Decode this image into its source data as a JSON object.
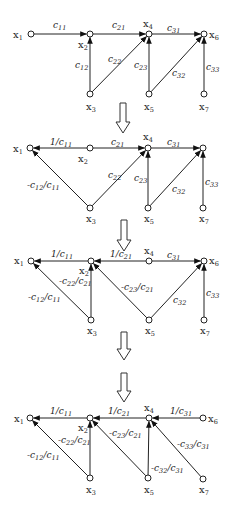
{
  "diagrams": [
    {
      "name": "original-graph",
      "nodes": [
        {
          "id": "x1",
          "label": "x",
          "sub": "1",
          "x": 31,
          "y": 34,
          "lx": 13,
          "ly": 38
        },
        {
          "id": "x2",
          "label": "x",
          "sub": "2",
          "x": 90,
          "y": 34,
          "lx": 78,
          "ly": 48
        },
        {
          "id": "x3",
          "label": "x",
          "sub": "3",
          "x": 90,
          "y": 94,
          "lx": 86,
          "ly": 110
        },
        {
          "id": "x4",
          "label": "x",
          "sub": "4",
          "x": 149,
          "y": 34,
          "lx": 143,
          "ly": 27
        },
        {
          "id": "x5",
          "label": "x",
          "sub": "5",
          "x": 149,
          "y": 94,
          "lx": 144,
          "ly": 110
        },
        {
          "id": "x6",
          "label": "x",
          "sub": "6",
          "x": 204,
          "y": 34,
          "lx": 209,
          "ly": 38
        },
        {
          "id": "x7",
          "label": "x",
          "sub": "7",
          "x": 204,
          "y": 94,
          "lx": 199,
          "ly": 110
        }
      ],
      "edges": [
        {
          "from": "x1",
          "to": "x2",
          "label": "c",
          "sub": "11",
          "lx": 53,
          "ly": 28
        },
        {
          "from": "x3",
          "to": "x2",
          "label": "c",
          "sub": "12",
          "lx": 75,
          "ly": 68
        },
        {
          "from": "x2",
          "to": "x4",
          "label": "c",
          "sub": "21",
          "lx": 112,
          "ly": 28
        },
        {
          "from": "x3",
          "to": "x4",
          "label": "c",
          "sub": "22",
          "lx": 108,
          "ly": 62
        },
        {
          "from": "x5",
          "to": "x4",
          "label": "c",
          "sub": "23",
          "lx": 134,
          "ly": 68
        },
        {
          "from": "x4",
          "to": "x6",
          "label": "c",
          "sub": "31",
          "lx": 167,
          "ly": 31
        },
        {
          "from": "x5",
          "to": "x6",
          "label": "c",
          "sub": "32",
          "lx": 172,
          "ly": 76
        },
        {
          "from": "x7",
          "to": "x6",
          "label": "c",
          "sub": "33",
          "lx": 206,
          "ly": 70
        }
      ]
    },
    {
      "name": "step-1-graph",
      "nodes": [
        {
          "id": "x1",
          "label": "x",
          "sub": "1",
          "x": 30,
          "y": 148,
          "lx": 13,
          "ly": 152
        },
        {
          "id": "x2",
          "label": "x",
          "sub": "2",
          "x": 90,
          "y": 148,
          "lx": 78,
          "ly": 162
        },
        {
          "id": "x3",
          "label": "x",
          "sub": "3",
          "x": 90,
          "y": 208,
          "lx": 86,
          "ly": 222
        },
        {
          "id": "x4",
          "label": "x",
          "sub": "4",
          "x": 148,
          "y": 148,
          "lx": 143,
          "ly": 140
        },
        {
          "id": "x5",
          "label": "x",
          "sub": "5",
          "x": 148,
          "y": 208,
          "lx": 144,
          "ly": 222
        },
        {
          "id": "x6",
          "label": "x",
          "sub": "6",
          "x": 203,
          "y": 148,
          "lx": 0,
          "ly": 0,
          "hidden_label": true
        },
        {
          "id": "x7",
          "label": "x",
          "sub": "7",
          "x": 203,
          "y": 208,
          "lx": 199,
          "ly": 222
        }
      ],
      "edges": [
        {
          "from": "x2",
          "to": "x1",
          "label": "1/c",
          "sub": "11",
          "lx": 50,
          "ly": 145
        },
        {
          "from": "x3",
          "to": "x1",
          "label": "-c",
          "sub": "12",
          "tail": "/c",
          "sub2": "11",
          "lx": 27,
          "ly": 188
        },
        {
          "from": "x2",
          "to": "x4",
          "label": "c",
          "sub": "21",
          "lx": 111,
          "ly": 145
        },
        {
          "from": "x3",
          "to": "x4",
          "label": "c",
          "sub": "22",
          "lx": 108,
          "ly": 178
        },
        {
          "from": "x5",
          "to": "x4",
          "label": "c",
          "sub": "23",
          "lx": 134,
          "ly": 181
        },
        {
          "from": "x4",
          "to": "x6",
          "label": "c",
          "sub": "31",
          "lx": 167,
          "ly": 145
        },
        {
          "from": "x5",
          "to": "x6",
          "label": "c",
          "sub": "32",
          "lx": 172,
          "ly": 192
        },
        {
          "from": "x7",
          "to": "x6",
          "label": "c",
          "sub": "33",
          "lx": 205,
          "ly": 185
        }
      ]
    },
    {
      "name": "step-2-graph",
      "nodes": [
        {
          "id": "x1",
          "label": "x",
          "sub": "1",
          "x": 31,
          "y": 261,
          "lx": 14,
          "ly": 264
        },
        {
          "id": "x2",
          "label": "x",
          "sub": "2",
          "x": 91,
          "y": 261,
          "lx": 79,
          "ly": 274
        },
        {
          "id": "x3",
          "label": "x",
          "sub": "3",
          "x": 91,
          "y": 320,
          "lx": 87,
          "ly": 334
        },
        {
          "id": "x4",
          "label": "x",
          "sub": "4",
          "x": 149,
          "y": 261,
          "lx": 144,
          "ly": 254
        },
        {
          "id": "x5",
          "label": "x",
          "sub": "5",
          "x": 149,
          "y": 320,
          "lx": 145,
          "ly": 334
        },
        {
          "id": "x6",
          "label": "x",
          "sub": "6",
          "x": 204,
          "y": 261,
          "lx": 209,
          "ly": 264
        },
        {
          "id": "x7",
          "label": "x",
          "sub": "7",
          "x": 204,
          "y": 320,
          "lx": 200,
          "ly": 334
        }
      ],
      "edges": [
        {
          "from": "x2",
          "to": "x1",
          "label": "1/c",
          "sub": "11",
          "lx": 51,
          "ly": 257
        },
        {
          "from": "x3",
          "to": "x1",
          "label": "-c",
          "sub": "12",
          "tail": "/c",
          "sub2": "11",
          "lx": 28,
          "ly": 300
        },
        {
          "from": "x4",
          "to": "x2",
          "label": "1/c",
          "sub": "21",
          "lx": 110,
          "ly": 257
        },
        {
          "from": "x3",
          "to": "x2",
          "label": "-c",
          "sub": "22",
          "tail": "/c",
          "sub2": "21",
          "lx": 59,
          "ly": 284
        },
        {
          "from": "x5",
          "to": "x2",
          "label": "-c",
          "sub": "23",
          "tail": "/c",
          "sub2": "21",
          "lx": 121,
          "ly": 290
        },
        {
          "from": "x4",
          "to": "x6",
          "label": "c",
          "sub": "31",
          "lx": 167,
          "ly": 258
        },
        {
          "from": "x5",
          "to": "x6",
          "label": "c",
          "sub": "32",
          "lx": 173,
          "ly": 303
        },
        {
          "from": "x7",
          "to": "x6",
          "label": "c",
          "sub": "33",
          "lx": 206,
          "ly": 296
        }
      ]
    },
    {
      "name": "final-graph",
      "nodes": [
        {
          "id": "x1",
          "label": "x",
          "sub": "1",
          "x": 30,
          "y": 418,
          "lx": 14,
          "ly": 422
        },
        {
          "id": "x2",
          "label": "x",
          "sub": "2",
          "x": 90,
          "y": 418,
          "lx": 78,
          "ly": 431
        },
        {
          "id": "x3",
          "label": "x",
          "sub": "3",
          "x": 90,
          "y": 478,
          "lx": 86,
          "ly": 493
        },
        {
          "id": "x4",
          "label": "x",
          "sub": "4",
          "x": 149,
          "y": 418,
          "lx": 144,
          "ly": 411
        },
        {
          "id": "x5",
          "label": "x",
          "sub": "5",
          "x": 148,
          "y": 478,
          "lx": 144,
          "ly": 493
        },
        {
          "id": "x6",
          "label": "x",
          "sub": "6",
          "x": 203,
          "y": 418,
          "lx": 208,
          "ly": 422
        },
        {
          "id": "x7",
          "label": "x",
          "sub": "7",
          "x": 203,
          "y": 479,
          "lx": 199,
          "ly": 493
        }
      ],
      "edges": [
        {
          "from": "x2",
          "to": "x1",
          "label": "1/c",
          "sub": "11",
          "lx": 50,
          "ly": 414
        },
        {
          "from": "x3",
          "to": "x1",
          "label": "-c",
          "sub": "12",
          "tail": "/c",
          "sub2": "11",
          "lx": 27,
          "ly": 458
        },
        {
          "from": "x4",
          "to": "x2",
          "label": "1/c",
          "sub": "21",
          "lx": 108,
          "ly": 414
        },
        {
          "from": "x3",
          "to": "x2",
          "label": "-c",
          "sub": "22",
          "tail": "/c",
          "sub2": "21",
          "lx": 58,
          "ly": 443
        },
        {
          "from": "x5",
          "to": "x2",
          "label": "-c",
          "sub": "23",
          "tail": "/c",
          "sub2": "21",
          "lx": 109,
          "ly": 436
        },
        {
          "from": "x6",
          "to": "x4",
          "label": "1/c",
          "sub": "31",
          "lx": 170,
          "ly": 414
        },
        {
          "from": "x5",
          "to": "x4",
          "label": "-c",
          "sub": "32",
          "tail": "/c",
          "sub2": "31",
          "lx": 151,
          "ly": 471
        },
        {
          "from": "x7",
          "to": "x4",
          "label": "-c",
          "sub": "33",
          "tail": "/c",
          "sub2": "31",
          "lx": 177,
          "ly": 447
        }
      ]
    }
  ],
  "transition_arrows": [
    {
      "name": "step-arrow-1",
      "cx": 123,
      "top": 103,
      "bottom": 133
    },
    {
      "name": "step-arrow-2",
      "cx": 124,
      "top": 220,
      "bottom": 251
    },
    {
      "name": "step-arrow-3",
      "cx": 124,
      "top": 332,
      "bottom": 360
    },
    {
      "name": "step-arrow-4",
      "cx": 124,
      "top": 373,
      "bottom": 402
    }
  ]
}
